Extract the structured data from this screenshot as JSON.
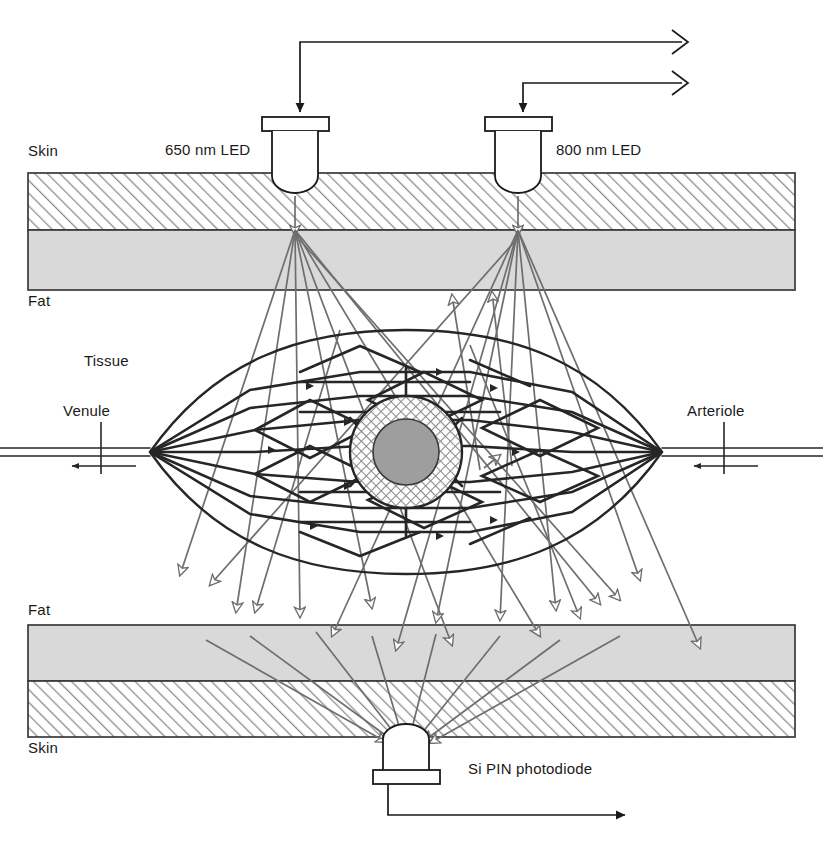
{
  "figure": {
    "background_color": "#ffffff",
    "ink_color": "#1a1a1a",
    "ray_color": "#6e6e6e",
    "skin_fill": "#ffffff",
    "skin_hatch_color": "#8a8a8a",
    "fat_fill": "#d9d9d9",
    "vessel_line_color": "#262626",
    "capillary_core_fill": "#9e9e9e",
    "capillary_ring_fill": "#ffffff"
  },
  "labels": {
    "skin_top": "Skin",
    "fat_top": "Fat",
    "tissue": "Tissue",
    "venule": "Venule",
    "arteriole": "Arteriole",
    "fat_bottom": "Fat",
    "skin_bottom": "Skin",
    "led_red": "650 nm LED",
    "led_infrared": "800 nm LED",
    "photodiode": "Si PIN photodiode"
  },
  "components": {
    "led_red": {
      "name": "650 nm LED",
      "wavelength_nm": 650,
      "kind": "light-emitting-diode",
      "body_center_x": 295,
      "flange_y": 117,
      "drive_wire": "input",
      "arrow_direction": "down"
    },
    "led_infrared": {
      "name": "800 nm LED",
      "wavelength_nm": 800,
      "kind": "light-emitting-diode",
      "body_center_x": 518,
      "flange_y": 117,
      "drive_wire": "input",
      "arrow_direction": "down"
    },
    "detector": {
      "name": "Si PIN photodiode",
      "kind": "silicon-pin-photodiode",
      "body_center_x": 406,
      "flange_y": 770,
      "signal_wire": "output",
      "arrow_direction": "right"
    }
  },
  "layers": [
    {
      "name": "Skin",
      "side": "top",
      "fill": "hatch",
      "y_top": 173,
      "y_bottom": 230
    },
    {
      "name": "Fat",
      "side": "top",
      "fill": "solid",
      "y_top": 230,
      "y_bottom": 290
    },
    {
      "name": "Tissue",
      "side": "middle",
      "fill": "none",
      "y_top": 290,
      "y_bottom": 625
    },
    {
      "name": "Fat",
      "side": "bottom",
      "fill": "solid",
      "y_top": 625,
      "y_bottom": 681
    },
    {
      "name": "Skin",
      "side": "bottom",
      "fill": "hatch",
      "y_top": 681,
      "y_bottom": 737
    }
  ],
  "vasculature": {
    "inlet": {
      "label": "Arteriole",
      "side": "right",
      "flow_direction": "left"
    },
    "outlet": {
      "label": "Venule",
      "side": "left",
      "flow_direction": "left"
    },
    "bed_shape": "lens",
    "bed_center": [
      406,
      452
    ],
    "capillary_core": {
      "outer_radius": 56,
      "inner_radius": 33,
      "hatch": "crosshatch"
    }
  },
  "wiring": {
    "led_red_wire_corner_x": 300,
    "led_infrared_wire_corner_x": 523,
    "led_red_wire_y": 42,
    "led_infrared_wire_y": 83,
    "connector_x": 682,
    "connector_glyph": "angle-bracket",
    "output_wire_y": 815,
    "output_arrow_x": 628
  }
}
